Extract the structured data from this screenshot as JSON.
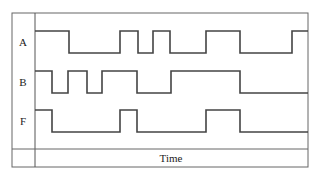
{
  "diagram": {
    "type": "timing-diagram",
    "x_axis_label": "Time",
    "signals": [
      {
        "name": "A",
        "transitions_x": [
          35,
          69,
          120,
          138,
          153,
          170,
          206,
          240,
          292,
          308
        ],
        "start_level": "high"
      },
      {
        "name": "B",
        "transitions_x": [
          35,
          52,
          68,
          87,
          102,
          137,
          171,
          240,
          308
        ],
        "start_level": "high"
      },
      {
        "name": "F",
        "transitions_x": [
          35,
          52,
          120,
          137,
          206,
          240,
          308
        ],
        "start_level": "high"
      }
    ],
    "colors": {
      "line": "#444444",
      "border": "#666666"
    }
  }
}
